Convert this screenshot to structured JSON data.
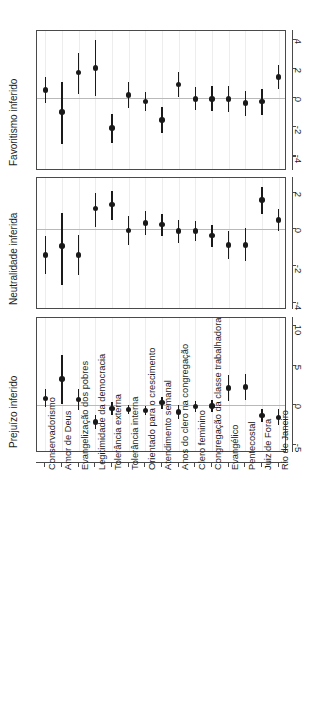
{
  "figure": {
    "orientation": "rotated-90-ccw",
    "categories": [
      "Conservadorismo",
      "Amor de Deus",
      "Evangelização dos pobres",
      "Legitimidade da democracia",
      "Tolerância externa",
      "Tolerância interna",
      "Orientado para o crescimento",
      "Atendimento semanal",
      "Anos do clero na congregação",
      "Clero feminino",
      "Congregação da classe trabalhadora",
      "Evangélico",
      "Pentecostal",
      "Juiz de Fora",
      "Rio de Janeiro"
    ],
    "colors": {
      "point": "#1a1a1a",
      "interval": "#1a1a1a",
      "frame": "#4a4a4a",
      "gridline": "#ededed",
      "zeroline": "#b9b9b9",
      "background": "#ffffff"
    }
  },
  "chart_data": [
    {
      "type": "scatter",
      "title": "Favoritismo inferido",
      "xlabel": "",
      "ylabel": "Favoritismo inferido",
      "ylim": [
        -5,
        4.6
      ],
      "yticks": [
        4,
        2,
        0,
        -2,
        -4
      ],
      "ytick_labels": [
        "4",
        "2",
        "0",
        "-2",
        "-4"
      ],
      "grid": true,
      "zero_reference": 0,
      "categories": [
        "Conservadorismo",
        "Amor de Deus",
        "Evangelização dos pobres",
        "Legitimidade da democracia",
        "Tolerância externa",
        "Tolerância interna",
        "Orientado para o crescimento",
        "Atendimento semanal",
        "Anos do clero na congregação",
        "Clero feminino",
        "Congregação da classe trabalhadora",
        "Evangélico",
        "Pentecostal",
        "Juiz de Fora",
        "Rio de Janeiro"
      ],
      "estimates": [
        0.55,
        -0.95,
        1.75,
        2.05,
        -2.05,
        0.2,
        -0.25,
        -1.5,
        0.95,
        -0.05,
        -0.05,
        -0.05,
        -0.35,
        -0.25,
        1.45
      ],
      "ci_low": [
        -0.35,
        -3.15,
        0.25,
        0.15,
        -3.05,
        -0.7,
        -0.9,
        -2.4,
        0.1,
        -0.85,
        -0.9,
        -0.95,
        -1.25,
        -1.15,
        0.65
      ],
      "ci_high": [
        1.45,
        1.1,
        3.1,
        3.95,
        -1.1,
        1.1,
        0.4,
        -0.6,
        1.8,
        0.75,
        0.8,
        0.85,
        0.5,
        0.65,
        2.25
      ]
    },
    {
      "type": "scatter",
      "title": "Neutralidade inferida",
      "xlabel": "",
      "ylabel": "Neutralidade inferida",
      "ylim": [
        -4.4,
        2.8
      ],
      "yticks": [
        2,
        0,
        -2,
        -4
      ],
      "ytick_labels": [
        "2",
        "0",
        "-2",
        "-4"
      ],
      "grid": true,
      "zero_reference": 0,
      "categories": [
        "Conservadorismo",
        "Amor de Deus",
        "Evangelização dos pobres",
        "Legitimidade da democracia",
        "Tolerância externa",
        "Tolerância interna",
        "Orientado para o crescimento",
        "Atendimento semanal",
        "Anos do clero na congregação",
        "Clero feminino",
        "Congregação da classe trabalhadora",
        "Evangélico",
        "Pentecostal",
        "Juiz de Fora",
        "Rio de Janeiro"
      ],
      "estimates": [
        -1.4,
        -0.9,
        -1.4,
        1.15,
        1.35,
        -0.05,
        0.35,
        0.25,
        -0.1,
        -0.1,
        -0.35,
        -0.85,
        -0.85,
        1.6,
        0.5
      ],
      "ci_low": [
        -2.45,
        -3.05,
        -2.5,
        0.1,
        0.5,
        -0.85,
        -0.3,
        -0.35,
        -0.75,
        -0.65,
        -0.95,
        -1.6,
        -1.75,
        0.85,
        -0.1
      ],
      "ci_high": [
        -0.35,
        0.9,
        -0.3,
        2.0,
        2.1,
        0.75,
        1.0,
        0.85,
        0.5,
        0.45,
        0.25,
        -0.1,
        0.05,
        2.3,
        1.1
      ]
    },
    {
      "type": "scatter",
      "title": "Prejuízo inferido",
      "xlabel": "",
      "ylabel": "Prejuízo inferido",
      "ylim": [
        -6,
        11
      ],
      "yticks": [
        10,
        5,
        0,
        -5
      ],
      "ytick_labels": [
        "10",
        "5",
        "0",
        "-5"
      ],
      "grid": true,
      "zero_reference": 0,
      "categories": [
        "Conservadorismo",
        "Amor de Deus",
        "Evangelização dos pobres",
        "Legitimidade da democracia",
        "Tolerância externa",
        "Tolerância interna",
        "Orientado para o crescimento",
        "Atendimento semanal",
        "Anos do clero na congregação",
        "Clero feminino",
        "Congregação da classe trabalhadora",
        "Evangélico",
        "Pentecostal",
        "Juiz de Fora",
        "Rio de Janeiro"
      ],
      "estimates": [
        0.9,
        3.3,
        0.7,
        -2.1,
        -0.4,
        -0.5,
        -0.65,
        0.35,
        -0.85,
        -0.15,
        -0.1,
        2.2,
        2.3,
        -1.3,
        -1.5
      ],
      "ci_low": [
        -0.2,
        0.2,
        -0.6,
        -3.0,
        -1.2,
        -1.1,
        -1.2,
        -0.4,
        -1.7,
        -0.85,
        -0.9,
        0.6,
        0.7,
        -2.1,
        -2.5
      ],
      "ci_high": [
        2.0,
        6.4,
        2.0,
        -1.2,
        0.4,
        0.1,
        -0.1,
        1.1,
        0.0,
        0.55,
        0.7,
        3.8,
        3.9,
        -0.5,
        -0.5
      ]
    }
  ]
}
